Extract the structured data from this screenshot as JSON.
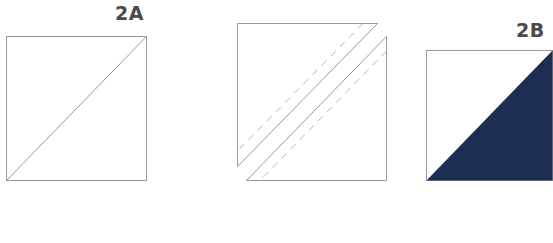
{
  "figures": [
    {
      "id": "2A",
      "label": "2A",
      "description": "Square with one diagonal line from bottom-left to top-right"
    },
    {
      "id": "middle",
      "label": "",
      "description": "Square cut along diagonal into two triangles separated by a gap, with dashed seam lines on each side"
    },
    {
      "id": "2B",
      "label": "2B",
      "description": "Half-square triangle: top-left white, bottom-right navy"
    }
  ],
  "colors": {
    "outline": "#9a9a9a",
    "navy": "#1c2e52",
    "label": "#4a4a4a"
  }
}
